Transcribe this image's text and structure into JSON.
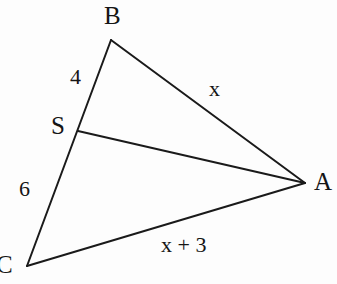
{
  "figure": {
    "background_color": "#fdfdfd",
    "stroke_color": "#1a1a1a",
    "width": 337,
    "height": 284,
    "vertices": {
      "B": {
        "x": 111,
        "y": 40
      },
      "A": {
        "x": 305,
        "y": 183
      },
      "C": {
        "x": 27,
        "y": 266
      },
      "S": {
        "x": 78,
        "y": 131
      }
    },
    "segments": [
      {
        "name": "BA",
        "from": "B",
        "to": "A"
      },
      {
        "name": "BC",
        "from": "B",
        "to": "C"
      },
      {
        "name": "CA",
        "from": "C",
        "to": "A"
      },
      {
        "name": "SA",
        "from": "S",
        "to": "A"
      }
    ],
    "vertex_labels": {
      "B": "B",
      "A": "A",
      "C": "C",
      "S": "S"
    },
    "measure_labels": {
      "BS": "4",
      "SC": "6",
      "BA": "x",
      "CA": "x + 3"
    }
  }
}
